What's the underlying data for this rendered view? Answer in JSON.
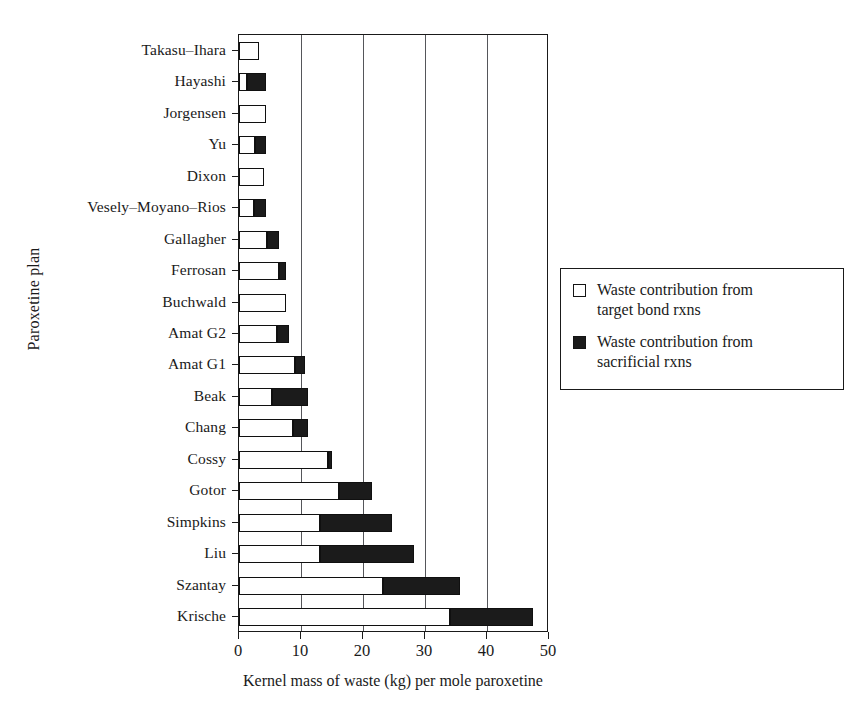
{
  "chart_data": {
    "type": "bar",
    "orientation": "horizontal",
    "stacked": true,
    "title": "",
    "xlabel": "Kernel mass of waste (kg) per mole paroxetine",
    "ylabel": "Paroxetine plan",
    "xlim": [
      0,
      50
    ],
    "xticks": [
      0,
      10,
      20,
      30,
      40,
      50
    ],
    "xticklabels": [
      "0",
      "10",
      "20",
      "30",
      "40",
      "50"
    ],
    "grid": "vertical",
    "legend_position": "right-outside",
    "categories": [
      "Takasu–Ihara",
      "Hayashi",
      "Jorgensen",
      "Yu",
      "Dixon",
      "Vesely–Moyano–Rios",
      "Gallagher",
      "Ferrosan",
      "Buchwald",
      "Amat G2",
      "Amat G1",
      "Beak",
      "Chang",
      "Cossy",
      "Gotor",
      "Simpkins",
      "Liu",
      "Szantay",
      "Krische"
    ],
    "series": [
      {
        "name": "Waste contribution from target bond rxns",
        "color": "#ffffff",
        "values": [
          3.3,
          1.3,
          4.3,
          2.6,
          4.0,
          2.4,
          4.5,
          6.5,
          7.6,
          6.2,
          9.0,
          5.3,
          8.7,
          14.3,
          16.2,
          13.0,
          13.0,
          23.2,
          34.0
        ]
      },
      {
        "name": "Waste contribution from sacrificial rxns",
        "color": "#1b1b1b",
        "values": [
          0.0,
          3.0,
          0.0,
          1.7,
          0.0,
          1.9,
          1.9,
          1.1,
          0.0,
          1.9,
          1.7,
          5.9,
          2.5,
          0.7,
          5.3,
          11.6,
          15.3,
          12.4,
          13.5
        ]
      }
    ],
    "totals": [
      3.3,
      4.3,
      4.3,
      4.3,
      4.0,
      4.3,
      6.4,
      7.6,
      7.6,
      8.1,
      10.7,
      11.2,
      11.2,
      15.0,
      21.5,
      24.6,
      28.3,
      35.6,
      47.5
    ]
  },
  "legend": {
    "entries": [
      {
        "swatch": "white-square",
        "line1": "Waste contribution from",
        "line2": "target bond rxns"
      },
      {
        "swatch": "black-square",
        "line1": "Waste contribution from",
        "line2": "sacrificial rxns"
      }
    ]
  }
}
